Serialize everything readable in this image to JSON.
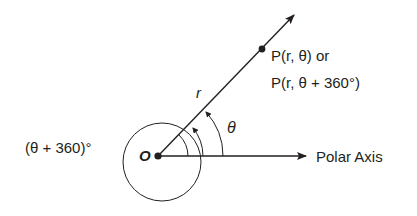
{
  "diagram": {
    "title": "",
    "origin_label": "O",
    "radius_label": "r",
    "angle_label": "θ",
    "point_label_line1": "P(r, θ) or",
    "point_label_line2": "P(r, θ + 360°)",
    "coterminal_label": "(θ + 360)°",
    "axis_label": "Polar Axis"
  },
  "colors": {
    "ink": "#231f20",
    "background": "#ffffff"
  }
}
